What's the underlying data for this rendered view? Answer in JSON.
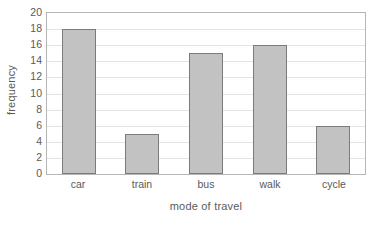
{
  "chart_data": {
    "type": "bar",
    "title": "",
    "xlabel": "mode of travel",
    "ylabel": "frequency",
    "categories": [
      "car",
      "train",
      "bus",
      "walk",
      "cycle"
    ],
    "values": [
      18,
      5,
      15,
      16,
      6
    ],
    "ylim": [
      0,
      20
    ],
    "ytick_step": 2,
    "yticks": [
      0,
      2,
      4,
      6,
      8,
      10,
      12,
      14,
      16,
      18,
      20
    ],
    "ytick_labels": [
      "0",
      "2",
      "4",
      "6",
      "8",
      "10",
      "12",
      "14",
      "16",
      "18",
      "20"
    ],
    "grid": true,
    "grid_axis": "y",
    "legend": null,
    "legend_position": "none",
    "colors": {
      "bar_fill": "#c2c2c2",
      "bar_border": "#7b7b7b",
      "gridline": "#e4e4e4",
      "frame": "#b6b6b6",
      "text": "#5a5a5a",
      "background": "#ffffff"
    }
  }
}
